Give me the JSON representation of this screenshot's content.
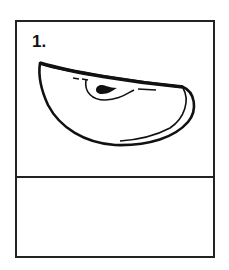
{
  "panel": {
    "number_label": "1.",
    "illustration": "apple-slice",
    "line_color": "#222222",
    "background_color": "#ffffff"
  }
}
